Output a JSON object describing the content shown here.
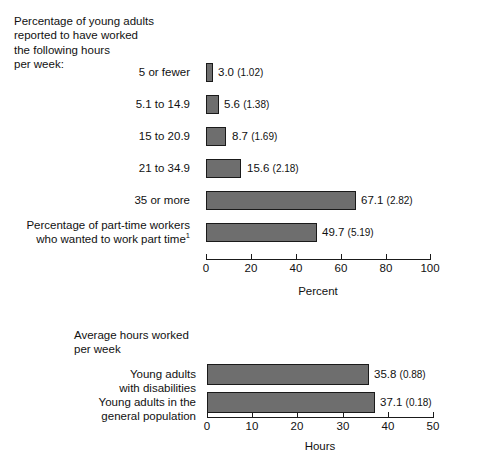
{
  "chart_data": [
    {
      "type": "bar",
      "orientation": "horizontal",
      "title": "Percentage of young adults\nreported to have worked\nthe following hours\nper week:",
      "xlabel": "Percent",
      "ylabel": "",
      "xlim": [
        0,
        100
      ],
      "xticks": [
        0,
        20,
        40,
        60,
        80,
        100
      ],
      "xticklabels": [
        "0",
        "20",
        "40",
        "60",
        "80",
        "100"
      ],
      "grid": false,
      "legend": false,
      "categories": [
        "5 or fewer",
        "5.1 to 14.9",
        "15 to 20.9",
        "21 to 34.9",
        "35 or more",
        "Percentage of part-time workers\nwho wanted to work part time"
      ],
      "values": [
        3.0,
        5.6,
        8.7,
        15.6,
        67.1,
        49.7
      ],
      "standard_errors": [
        1.02,
        1.38,
        1.69,
        2.18,
        2.82,
        5.19
      ],
      "data_labels": [
        "3.0 (1.02)",
        "5.6 (1.38)",
        "8.7 (1.69)",
        "15.6 (2.18)",
        "67.1 (2.82)",
        "49.7 (5.19)"
      ],
      "footnote_marker": "1",
      "bar_color": "#6e6e6e",
      "bar_edge_color": "#1a1a1a"
    },
    {
      "type": "bar",
      "orientation": "horizontal",
      "title": "Average hours worked\nper week",
      "xlabel": "Hours",
      "ylabel": "",
      "xlim": [
        0,
        50
      ],
      "xticks": [
        0,
        10,
        20,
        30,
        40,
        50
      ],
      "xticklabels": [
        "0",
        "10",
        "20",
        "30",
        "40",
        "50"
      ],
      "grid": false,
      "legend": false,
      "categories": [
        "Young adults\nwith disabilities",
        "Young adults in the\ngeneral population"
      ],
      "values": [
        35.8,
        37.1
      ],
      "standard_errors": [
        0.88,
        0.18
      ],
      "data_labels": [
        "35.8 (0.88)",
        "37.1 (0.18)"
      ],
      "bar_color": "#6e6e6e",
      "bar_edge_color": "#1a1a1a"
    }
  ]
}
